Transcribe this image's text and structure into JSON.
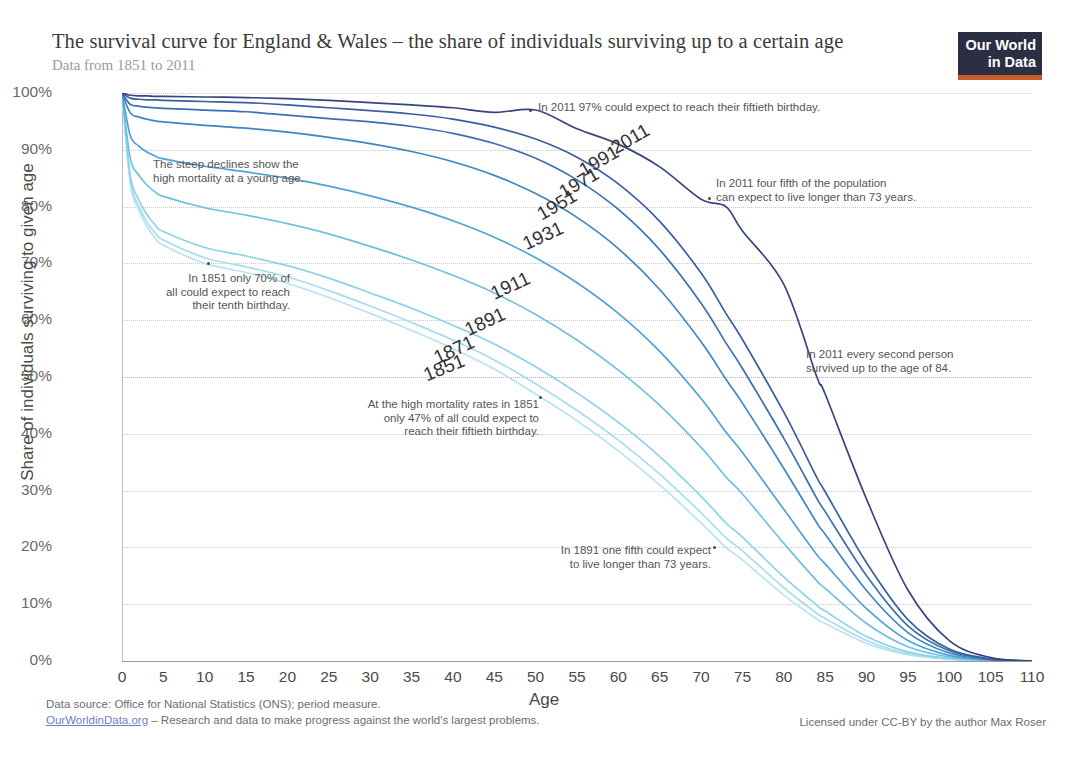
{
  "header": {
    "title": "The survival curve for England & Wales – the share of individuals surviving up to a certain age",
    "subtitle": "Data from 1851 to 2011",
    "logo_line1": "Our World",
    "logo_line2": "in Data"
  },
  "footer": {
    "data_source": "Data source: Office for National Statistics (ONS); period measure.",
    "link": "OurWorldinData.org",
    "tagline": " – Research and data to make progress against the world's largest problems.",
    "license": "Licensed under CC-BY by the author Max Roser"
  },
  "chart_data": {
    "type": "line",
    "title": "The survival curve for England & Wales – the share of individuals surviving up to a certain age",
    "subtitle": "Data from 1851 to 2011",
    "xlabel": "Age",
    "ylabel": "Share of individuals surviving to given age",
    "xlim": [
      0,
      110
    ],
    "ylim": [
      0,
      100
    ],
    "grid": true,
    "legend_position": "inline-curve-labels",
    "xticks": [
      0,
      5,
      10,
      15,
      20,
      25,
      30,
      35,
      40,
      45,
      50,
      55,
      60,
      65,
      70,
      75,
      80,
      85,
      90,
      95,
      100,
      105,
      110
    ],
    "xtick_labels": [
      "0",
      "5",
      "10",
      "15",
      "20",
      "25",
      "30",
      "35",
      "40",
      "45",
      "50",
      "55",
      "60",
      "65",
      "70",
      "75",
      "80",
      "85",
      "90",
      "95",
      "100",
      "105",
      "110"
    ],
    "yticks": [
      0,
      10,
      20,
      30,
      40,
      50,
      60,
      70,
      80,
      90,
      100
    ],
    "ytick_labels": [
      "0%",
      "10%",
      "20%",
      "30%",
      "40%",
      "50%",
      "60%",
      "70%",
      "80%",
      "90%",
      "100%"
    ],
    "x": [
      0,
      1,
      2,
      3,
      4,
      5,
      10,
      15,
      20,
      25,
      30,
      35,
      40,
      45,
      50,
      55,
      60,
      65,
      70,
      73,
      75,
      80,
      84,
      85,
      90,
      95,
      100,
      105,
      110
    ],
    "series": [
      {
        "name": "1851",
        "color": "#b6e4f2",
        "values": [
          100,
          84.0,
          79.5,
          76.5,
          74.5,
          73.2,
          70.0,
          68.4,
          66.5,
          64.0,
          61.2,
          58.2,
          55.0,
          51.4,
          47.0,
          42.3,
          37.0,
          31.0,
          24.3,
          20.0,
          17.8,
          11.6,
          7.4,
          6.6,
          3.1,
          1.1,
          0.3,
          0.05,
          0
        ]
      },
      {
        "name": "1871",
        "color": "#a8dcee",
        "values": [
          100,
          84.6,
          80.2,
          77.3,
          75.4,
          74.1,
          71.0,
          69.4,
          67.6,
          65.2,
          62.5,
          59.6,
          56.5,
          53.0,
          48.8,
          44.1,
          38.9,
          32.9,
          26.1,
          21.7,
          19.4,
          12.9,
          8.4,
          7.5,
          3.6,
          1.3,
          0.35,
          0.06,
          0
        ]
      },
      {
        "name": "1891",
        "color": "#8ed1ea",
        "values": [
          100,
          85.5,
          81.3,
          78.6,
          76.8,
          75.6,
          72.8,
          71.3,
          69.6,
          67.4,
          64.8,
          62.1,
          59.1,
          55.8,
          51.8,
          47.2,
          42.0,
          36.0,
          29.0,
          24.3,
          21.8,
          14.8,
          9.8,
          8.8,
          4.3,
          1.6,
          0.45,
          0.08,
          0
        ]
      },
      {
        "name": "1911",
        "color": "#6ec0e2",
        "values": [
          100,
          88.5,
          85.6,
          83.8,
          82.6,
          81.8,
          79.8,
          78.5,
          77.0,
          75.2,
          73.0,
          70.6,
          67.9,
          64.8,
          61.0,
          56.5,
          51.2,
          45.0,
          37.6,
          32.4,
          29.4,
          20.7,
          14.1,
          12.8,
          6.6,
          2.5,
          0.7,
          0.12,
          0
        ]
      },
      {
        "name": "1931",
        "color": "#4fa3d4",
        "values": [
          100,
          92.5,
          90.7,
          89.6,
          88.9,
          88.4,
          87.1,
          86.1,
          85.0,
          83.6,
          81.9,
          79.9,
          77.5,
          74.6,
          71.0,
          66.6,
          61.2,
          54.5,
          46.2,
          40.3,
          36.7,
          26.7,
          18.7,
          17.1,
          9.2,
          3.6,
          1.0,
          0.18,
          0
        ]
      },
      {
        "name": "1951",
        "color": "#3f86c2",
        "values": [
          100,
          96.5,
          95.8,
          95.4,
          95.1,
          94.9,
          94.3,
          93.8,
          93.1,
          92.2,
          91.1,
          89.7,
          87.9,
          85.5,
          82.3,
          78.1,
          72.6,
          65.4,
          56.2,
          49.6,
          45.4,
          33.9,
          24.3,
          22.3,
          12.4,
          5.0,
          1.4,
          0.25,
          0
        ]
      },
      {
        "name": "1971",
        "color": "#3a6fb0",
        "values": [
          100,
          98.0,
          97.7,
          97.5,
          97.4,
          97.3,
          97.0,
          96.7,
          96.1,
          95.5,
          94.9,
          94.1,
          92.9,
          91.1,
          88.5,
          84.7,
          79.5,
          72.4,
          63.0,
          56.0,
          51.5,
          39.2,
          28.6,
          26.3,
          15.0,
          6.2,
          1.8,
          0.32,
          0
        ]
      },
      {
        "name": "1991",
        "color": "#3a5ea0",
        "values": [
          100,
          99.1,
          98.9,
          98.8,
          98.8,
          98.7,
          98.5,
          98.3,
          97.9,
          97.4,
          96.9,
          96.3,
          95.4,
          94.0,
          91.9,
          88.7,
          84.0,
          77.4,
          68.3,
          61.2,
          56.6,
          43.8,
          32.3,
          29.8,
          17.3,
          7.3,
          2.1,
          0.38,
          0
        ]
      },
      {
        "name": "2011",
        "color": "#36457e",
        "values": [
          100,
          99.6,
          99.5,
          99.5,
          99.4,
          99.4,
          99.3,
          99.2,
          99.0,
          98.7,
          98.3,
          97.9,
          97.4,
          96.6,
          97.0,
          93.7,
          91.0,
          87.0,
          81.3,
          80.0,
          75.7,
          66.3,
          50.0,
          47.0,
          28.5,
          12.5,
          3.6,
          0.6,
          0
        ]
      }
    ],
    "curve_labels": [
      {
        "name": "2011"
      },
      {
        "name": "1991"
      },
      {
        "name": "1971"
      },
      {
        "name": "1951"
      },
      {
        "name": "1931"
      },
      {
        "name": "1911"
      },
      {
        "name": "1891"
      },
      {
        "name": "1871"
      },
      {
        "name": "1851"
      }
    ],
    "annotations": [
      {
        "id": "steep-declines",
        "text": "The steep declines show the\nhigh mortality at a young age."
      },
      {
        "id": "1851-tenth-birthday",
        "text": "In 1851 only 70% of\nall could expect to reach\ntheir tenth birthday."
      },
      {
        "id": "1851-fiftieth-birthday",
        "text": "At the high mortality rates in 1851\nonly 47% of all could expect to\nreach their fiftieth birthday."
      },
      {
        "id": "2011-fiftieth-birthday",
        "text": "In 2011 97% could expect to reach their fiftieth birthday."
      },
      {
        "id": "2011-four-fifth",
        "text": "In 2011 four fifth of the population\ncan expect to live longer than 73 years."
      },
      {
        "id": "2011-age-84",
        "text": "In 2011 every second person\nsurvived up to the age of 84."
      },
      {
        "id": "1891-one-fifth",
        "text": "In 1891 one fifth could expect\nto live longer than 73 years."
      }
    ]
  }
}
